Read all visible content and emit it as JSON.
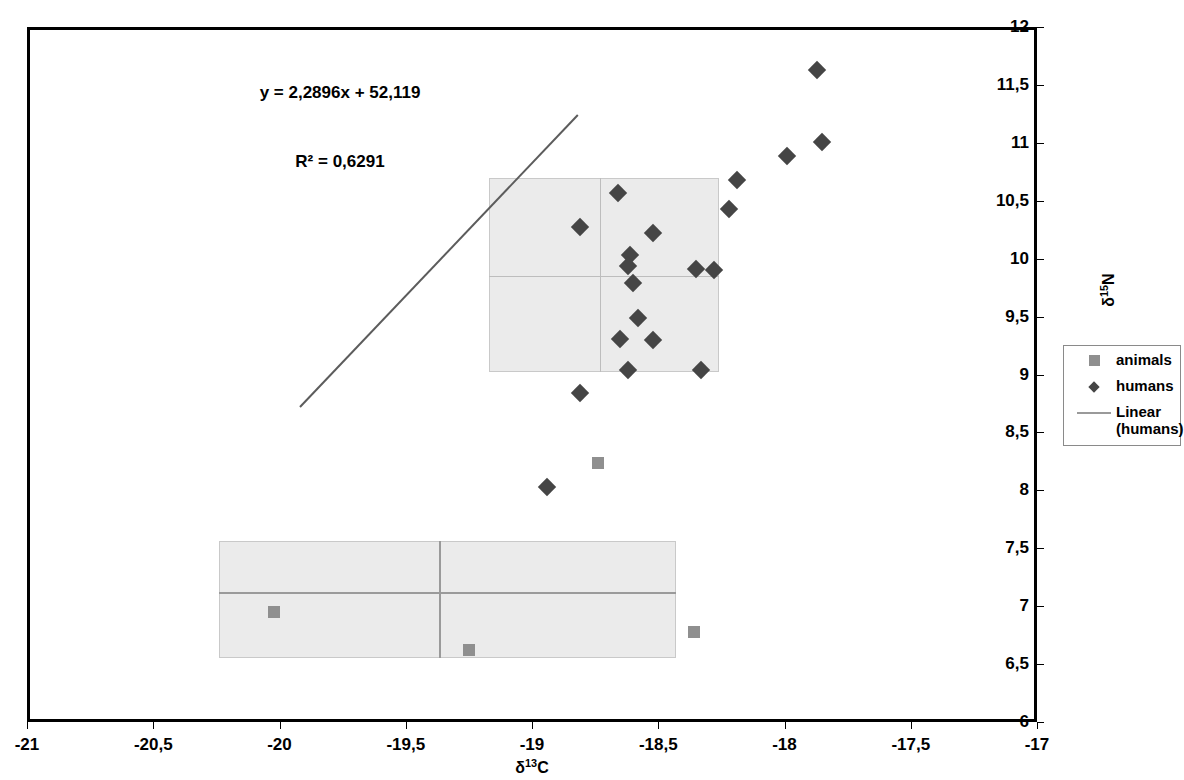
{
  "chart_data": {
    "type": "scatter",
    "title": "",
    "xlabel": "δ¹³C",
    "ylabel": "δ¹⁵N",
    "xlim": [
      -21,
      -17
    ],
    "ylim": [
      6,
      12
    ],
    "grid": false,
    "x_ticks": [
      "-21",
      "-20,5",
      "-20",
      "-19,5",
      "-19",
      "-18,5",
      "-18",
      "-17,5",
      "-17"
    ],
    "x_tick_values": [
      -21,
      -20.5,
      -20,
      -19.5,
      -19,
      -18.5,
      -18,
      -17.5,
      -17
    ],
    "y_ticks": [
      "6",
      "6,5",
      "7",
      "7,5",
      "8",
      "8,5",
      "9",
      "9,5",
      "10",
      "10,5",
      "11",
      "11,5",
      "12"
    ],
    "y_tick_values": [
      6,
      6.5,
      7,
      7.5,
      8,
      8.5,
      9,
      9.5,
      10,
      10.5,
      11,
      11.5,
      12
    ],
    "annotations": {
      "equation": "y = 2,2896x + 52,119",
      "r_squared": "R² = 0,6291"
    },
    "regression": {
      "slope": 2.2896,
      "intercept": 52.119,
      "r2": 0.6291,
      "x_start": -19.92,
      "y_start": 8.73,
      "x_end": -18.82,
      "y_end": 11.25
    },
    "series": [
      {
        "name": "humans",
        "marker": "diamond",
        "color": "#454545",
        "points": [
          {
            "x": -17.87,
            "y": 11.63
          },
          {
            "x": -17.85,
            "y": 11.01
          },
          {
            "x": -17.99,
            "y": 10.89
          },
          {
            "x": -18.19,
            "y": 10.68
          },
          {
            "x": -18.22,
            "y": 10.43
          },
          {
            "x": -18.66,
            "y": 10.57
          },
          {
            "x": -18.81,
            "y": 10.27
          },
          {
            "x": -18.52,
            "y": 10.22
          },
          {
            "x": -18.61,
            "y": 10.03
          },
          {
            "x": -18.62,
            "y": 9.94
          },
          {
            "x": -18.35,
            "y": 9.91
          },
          {
            "x": -18.28,
            "y": 9.9
          },
          {
            "x": -18.6,
            "y": 9.79
          },
          {
            "x": -18.58,
            "y": 9.49
          },
          {
            "x": -18.65,
            "y": 9.31
          },
          {
            "x": -18.52,
            "y": 9.3
          },
          {
            "x": -18.62,
            "y": 9.04
          },
          {
            "x": -18.33,
            "y": 9.04
          },
          {
            "x": -18.81,
            "y": 8.84
          },
          {
            "x": -18.94,
            "y": 8.03
          }
        ]
      },
      {
        "name": "animals",
        "marker": "square",
        "color": "#8f8f8f",
        "points": [
          {
            "x": -18.74,
            "y": 8.24
          },
          {
            "x": -20.02,
            "y": 6.95
          },
          {
            "x": -18.36,
            "y": 6.78
          },
          {
            "x": -19.25,
            "y": 6.62
          }
        ]
      }
    ],
    "cluster_boxes": [
      {
        "name": "humans-cluster-box",
        "x_range": [
          -19.17,
          -18.26
        ],
        "y_range": [
          9.02,
          10.7
        ],
        "mean_x": -18.73,
        "mean_y": 9.85,
        "fill": "#ebebeb",
        "border": "#c9c9c9"
      },
      {
        "name": "animals-cluster-box",
        "x_range": [
          -20.24,
          -18.43
        ],
        "y_range": [
          6.55,
          7.56
        ],
        "mean_x": -19.37,
        "mean_y": 7.12,
        "fill": "#ebebeb",
        "border": "#c9c9c9"
      }
    ],
    "legend": {
      "position": "right",
      "entries": [
        {
          "label": "animals",
          "marker": "square"
        },
        {
          "label": "humans",
          "marker": "diamond"
        },
        {
          "label": "Linear (humans)",
          "marker": "line"
        }
      ]
    }
  }
}
